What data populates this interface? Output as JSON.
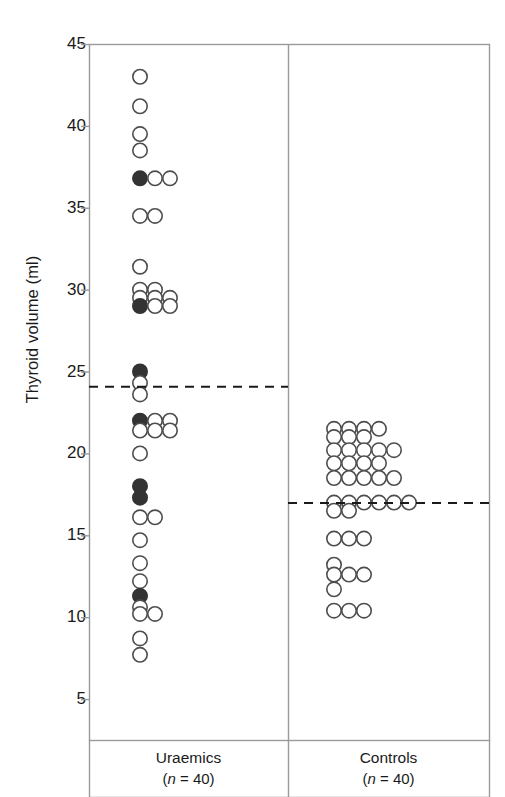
{
  "figure": {
    "ylabel": "Thyroid volume (ml)",
    "width": 505,
    "height": 797
  },
  "axis": {
    "ticks": [
      "45",
      "40",
      "35",
      "30",
      "25",
      "20",
      "15",
      "10",
      "5"
    ],
    "tick_values": [
      45,
      40,
      35,
      30,
      25,
      20,
      15,
      10,
      5
    ]
  },
  "groups": [
    {
      "name": "Uraemics",
      "label": "Uraemics",
      "n_label": "(n = 40)",
      "n": 40
    },
    {
      "name": "Controls",
      "label": "Controls",
      "n_label": "(n = 40)",
      "n": 40
    }
  ],
  "colors": {
    "open_marker_stroke": "#4d4d4d",
    "open_marker_fill": "#ffffff",
    "filled_marker": "#333333",
    "axis": "#9a9a9a",
    "dashed_line": "#1a1a1a",
    "text": "#1a1a1a",
    "background": "#ffffff"
  },
  "chart_data": {
    "type": "scatter",
    "title": "",
    "xlabel": "",
    "ylabel": "Thyroid volume (ml)",
    "ylim": [
      2.5,
      45
    ],
    "yticks": [
      5,
      10,
      15,
      20,
      25,
      30,
      35,
      40,
      45
    ],
    "grid": false,
    "legend": "none",
    "marker_styles": {
      "open": "open circle — thyroid volume, euthyroid subject",
      "filled": "filled circle — thyroid volume, subject with thyroid dysfunction"
    },
    "reference_lines": [
      {
        "group": "Uraemics",
        "value": 24.1,
        "style": "dashed",
        "label": "upper reference limit (uraemics)"
      },
      {
        "group": "Controls",
        "value": 17.0,
        "style": "dashed",
        "label": "upper reference limit (controls)"
      }
    ],
    "series": [
      {
        "name": "Uraemics",
        "n": 40,
        "rows": [
          {
            "value": 43.0,
            "open": 1,
            "filled": 0
          },
          {
            "value": 41.2,
            "open": 1,
            "filled": 0
          },
          {
            "value": 39.5,
            "open": 1,
            "filled": 0
          },
          {
            "value": 38.5,
            "open": 1,
            "filled": 0
          },
          {
            "value": 36.8,
            "open": 2,
            "filled": 1
          },
          {
            "value": 34.5,
            "open": 2,
            "filled": 0
          },
          {
            "value": 31.4,
            "open": 1,
            "filled": 0
          },
          {
            "value": 30.0,
            "open": 2,
            "filled": 0
          },
          {
            "value": 29.5,
            "open": 3,
            "filled": 0
          },
          {
            "value": 29.0,
            "open": 2,
            "filled": 1
          },
          {
            "value": 25.0,
            "open": 0,
            "filled": 1
          },
          {
            "value": 24.3,
            "open": 1,
            "filled": 0
          },
          {
            "value": 23.6,
            "open": 1,
            "filled": 0
          },
          {
            "value": 22.0,
            "open": 2,
            "filled": 1
          },
          {
            "value": 21.4,
            "open": 3,
            "filled": 0
          },
          {
            "value": 20.0,
            "open": 1,
            "filled": 0
          },
          {
            "value": 18.0,
            "open": 0,
            "filled": 1
          },
          {
            "value": 17.3,
            "open": 0,
            "filled": 1
          },
          {
            "value": 16.1,
            "open": 2,
            "filled": 0
          },
          {
            "value": 14.7,
            "open": 1,
            "filled": 0
          },
          {
            "value": 13.3,
            "open": 1,
            "filled": 0
          },
          {
            "value": 12.2,
            "open": 1,
            "filled": 0
          },
          {
            "value": 11.3,
            "open": 0,
            "filled": 1
          },
          {
            "value": 10.6,
            "open": 1,
            "filled": 0
          },
          {
            "value": 10.2,
            "open": 2,
            "filled": 0
          },
          {
            "value": 8.7,
            "open": 1,
            "filled": 0
          },
          {
            "value": 7.7,
            "open": 1,
            "filled": 0
          }
        ]
      },
      {
        "name": "Controls",
        "n": 40,
        "rows": [
          {
            "value": 21.5,
            "open": 4,
            "filled": 0
          },
          {
            "value": 21.0,
            "open": 3,
            "filled": 0
          },
          {
            "value": 20.2,
            "open": 5,
            "filled": 0
          },
          {
            "value": 19.4,
            "open": 4,
            "filled": 0
          },
          {
            "value": 18.5,
            "open": 5,
            "filled": 0
          },
          {
            "value": 17.0,
            "open": 6,
            "filled": 0
          },
          {
            "value": 16.5,
            "open": 2,
            "filled": 0
          },
          {
            "value": 14.8,
            "open": 3,
            "filled": 0
          },
          {
            "value": 13.2,
            "open": 1,
            "filled": 0
          },
          {
            "value": 12.6,
            "open": 3,
            "filled": 0
          },
          {
            "value": 11.7,
            "open": 1,
            "filled": 0
          },
          {
            "value": 10.4,
            "open": 3,
            "filled": 0
          }
        ]
      }
    ]
  }
}
